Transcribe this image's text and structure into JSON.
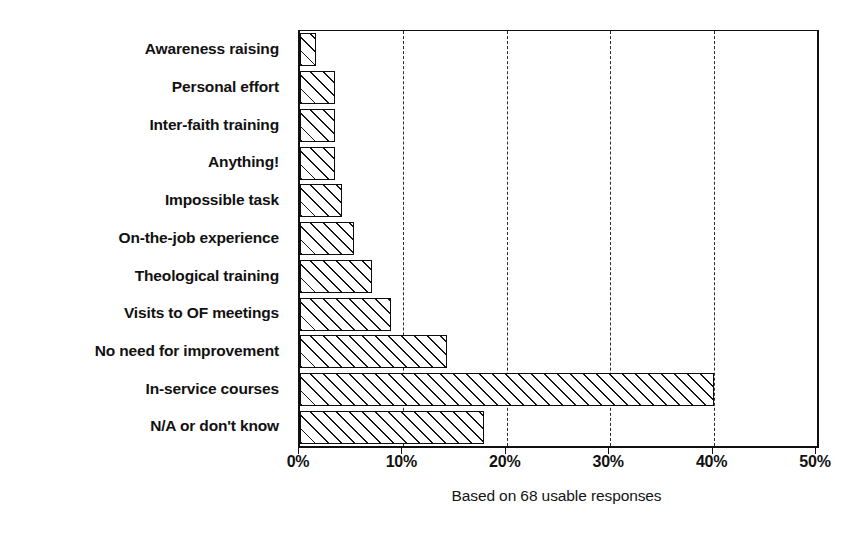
{
  "chart_data": {
    "type": "bar",
    "orientation": "horizontal",
    "title": "",
    "subtitle": "",
    "caption": "Based on 68 usable responses",
    "xlabel": "",
    "ylabel": "",
    "xlim": [
      0,
      50
    ],
    "grid": "vertical-dashed",
    "legend": "none",
    "xtick_labels": [
      "0%",
      "10%",
      "20%",
      "30%",
      "40%",
      "50%"
    ],
    "xtick_values": [
      0,
      10,
      20,
      30,
      40,
      50
    ],
    "categories": [
      "Awareness raising",
      "Personal effort",
      "Inter-faith training",
      "Anything!",
      "Impossible task",
      "On-the-job experience",
      "Theological training",
      "Visits to OF meetings",
      "No need for improvement",
      "In-service courses",
      "N/A or don't know"
    ],
    "values": [
      1.5,
      3.4,
      3.4,
      3.4,
      4.1,
      5.2,
      7.0,
      8.8,
      14.2,
      40.0,
      17.8
    ],
    "value_unit": "%",
    "bar_style": {
      "fill": "diagonal-hatch",
      "hatch_angle_deg": 45,
      "outline_color": "#0d0d0d",
      "background_color": "#ffffff"
    }
  }
}
